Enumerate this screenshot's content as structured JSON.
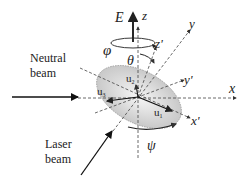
{
  "diagram": {
    "title": "",
    "labels": {
      "E": "E",
      "z": "z",
      "z_prime": "z'",
      "y": "y",
      "y_prime": "y'",
      "x": "x",
      "x_prime": "x'",
      "phi": "φ",
      "theta": "θ",
      "psi": "ψ",
      "u1": "u",
      "u1_sub": "1",
      "u2": "u",
      "u2_sub": "2",
      "u3": "u",
      "u3_sub": "3",
      "neutral_line1": "Neutral",
      "neutral_line2": "beam",
      "laser_line1": "Laser",
      "laser_line2": "beam"
    },
    "colors": {
      "ellipse_fill_center": "#f4f4f4",
      "ellipse_fill_edge": "#c8c8c8",
      "line": "#222222",
      "dashed": "#444444"
    }
  }
}
